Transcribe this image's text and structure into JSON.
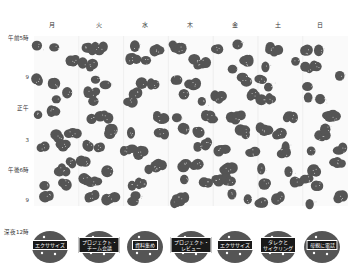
{
  "days": [
    {
      "label": "月",
      "x": 52
    },
    {
      "label": "火",
      "x": 99
    },
    {
      "label": "水",
      "x": 145
    },
    {
      "label": "木",
      "x": 190
    },
    {
      "label": "金",
      "x": 235
    },
    {
      "label": "土",
      "x": 278
    },
    {
      "label": "日",
      "x": 320
    }
  ],
  "times": [
    {
      "label": "午前5時",
      "y": 38
    },
    {
      "label": "9",
      "y": 77
    },
    {
      "label": "正午",
      "y": 108
    },
    {
      "label": "3",
      "y": 140
    },
    {
      "label": "午後6時",
      "y": 170
    },
    {
      "label": "9",
      "y": 200
    },
    {
      "label": "深夜12時",
      "y": 232
    }
  ],
  "activities": [
    {
      "label": "エクササイズ",
      "x": 50,
      "y": 245
    },
    {
      "label": "プロジェクト・\nチーム会議",
      "x": 99,
      "y": 245
    },
    {
      "label": "資料集め",
      "x": 145,
      "y": 245
    },
    {
      "label": "プロジェクト・\nレビュー",
      "x": 191,
      "y": 245
    },
    {
      "label": "エクササイズ",
      "x": 235,
      "y": 245
    },
    {
      "label": "タレクと\nサイクリング",
      "x": 278,
      "y": 245
    },
    {
      "label": "母親に電話",
      "x": 322,
      "y": 245
    }
  ],
  "colors": {
    "blob": "#555555",
    "tag_bg": "#1a1a1a",
    "dot": "#cfcfcf"
  }
}
